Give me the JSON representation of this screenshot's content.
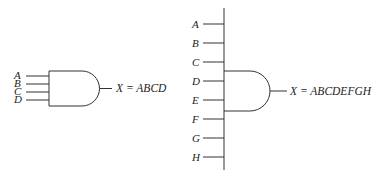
{
  "gate_4input": {
    "inputs": [
      "A",
      "B",
      "C",
      "D"
    ],
    "output_expression": "X = ABCD",
    "type": "AND"
  },
  "gate_8input": {
    "inputs": [
      "A",
      "B",
      "C",
      "D",
      "E",
      "F",
      "G",
      "H"
    ],
    "output_expression": "X = ABCDEFGH",
    "type": "AND"
  }
}
